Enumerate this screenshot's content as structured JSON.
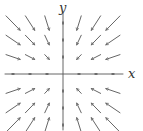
{
  "diagram": {
    "type": "vector_field",
    "axes": {
      "x_label": "x",
      "y_label": "y",
      "origin_px": [
        63,
        74
      ],
      "x_extent_px": [
        5,
        123
      ],
      "y_extent_px": [
        13,
        130
      ]
    },
    "colors": {
      "axis": "#555555",
      "arrow": "#666666",
      "label": "#333333"
    },
    "grid": {
      "columns_px": [
        13,
        30,
        47,
        79,
        96,
        113
      ],
      "rows_px": [
        23,
        40,
        57,
        91,
        108,
        125
      ],
      "scale": 0.28,
      "direction": "toward-origin"
    }
  }
}
